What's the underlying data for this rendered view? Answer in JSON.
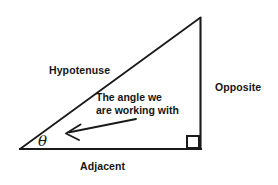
{
  "diagram": {
    "background_color": "#ffffff",
    "stroke_color": "#1a1a1a",
    "text_color": "#151515",
    "labels": {
      "hypotenuse": "Hypotenuse",
      "opposite": "Opposite",
      "adjacent": "Adjacent",
      "angle_symbol": "θ"
    },
    "annotation": {
      "line1": "The angle we",
      "line2": "are working with"
    },
    "geometry": {
      "left_vertex": [
        20,
        149
      ],
      "apex_vertex": [
        200,
        18
      ],
      "right_angle_vertex": [
        200,
        149
      ],
      "right_angle_marker_size": 12,
      "arrow_start": [
        136,
        119
      ],
      "arrow_end": [
        66,
        133
      ]
    }
  }
}
